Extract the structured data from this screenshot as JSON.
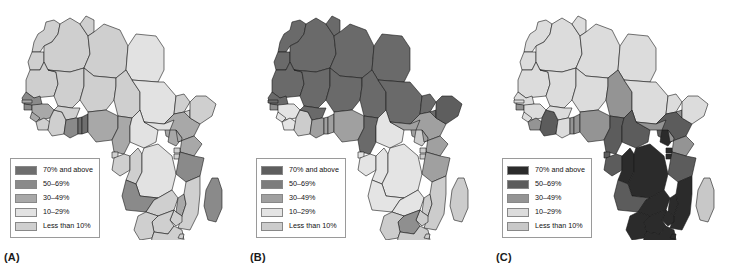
{
  "figure": {
    "title": "",
    "background": "#ffffff"
  },
  "legend_common": {
    "labels": [
      "70% and above",
      "50–69%",
      "30–49%",
      "10–29%",
      "Less than 10%"
    ]
  },
  "panels": [
    {
      "id": "A",
      "label": "(A)",
      "legend_colors": [
        "#6e6e6e",
        "#8a8a8a",
        "#a8a8a8",
        "#e2e2e2",
        "#cfcfcf"
      ],
      "regions": {
        "morocco": "#cfcfcf",
        "western_sahara": "#cfcfcf",
        "algeria": "#cfcfcf",
        "tunisia": "#cfcfcf",
        "libya": "#cfcfcf",
        "egypt": "#e2e2e2",
        "mauritania": "#cfcfcf",
        "mali": "#cfcfcf",
        "niger": "#cfcfcf",
        "chad": "#cfcfcf",
        "sudan": "#e2e2e2",
        "eritrea": "#cfcfcf",
        "djibouti": "#cfcfcf",
        "ethiopia": "#a8a8a8",
        "somalia": "#cfcfcf",
        "senegal": "#8a8a8a",
        "gambia": "#a8a8a8",
        "guinea_bissau": "#8a8a8a",
        "guinea": "#a8a8a8",
        "sierra_leone": "#a8a8a8",
        "liberia": "#cfcfcf",
        "cote_divoire": "#cfcfcf",
        "burkina_faso": "#cfcfcf",
        "ghana": "#8a8a8a",
        "togo": "#6e6e6e",
        "benin": "#6e6e6e",
        "nigeria": "#a8a8a8",
        "cameroon": "#a8a8a8",
        "car": "#e2e2e2",
        "south_sudan": "#e2e2e2",
        "equatorial_guinea": "#cfcfcf",
        "gabon": "#cfcfcf",
        "congo": "#cfcfcf",
        "drc": "#e2e2e2",
        "uganda": "#a8a8a8",
        "kenya": "#a8a8a8",
        "rwanda": "#cfcfcf",
        "burundi": "#cfcfcf",
        "tanzania": "#8a8a8a",
        "angola": "#8a8a8a",
        "zambia": "#cfcfcf",
        "malawi": "#a8a8a8",
        "mozambique": "#cfcfcf",
        "zimbabwe": "#cfcfcf",
        "botswana": "#cfcfcf",
        "namibia": "#cfcfcf",
        "south_africa": "#cfcfcf",
        "lesotho": "#cfcfcf",
        "swaziland": "#cfcfcf",
        "madagascar": "#8a8a8a"
      }
    },
    {
      "id": "B",
      "label": "(B)",
      "legend_colors": [
        "#5e5e5e",
        "#7d7d7d",
        "#a0a0a0",
        "#e4e4e4",
        "#cccccc"
      ],
      "regions": {
        "morocco": "#6a6a6a",
        "western_sahara": "#6a6a6a",
        "algeria": "#6a6a6a",
        "tunisia": "#6a6a6a",
        "libya": "#6a6a6a",
        "egypt": "#6a6a6a",
        "mauritania": "#6a6a6a",
        "mali": "#6a6a6a",
        "niger": "#6a6a6a",
        "chad": "#6a6a6a",
        "sudan": "#6a6a6a",
        "eritrea": "#6a6a6a",
        "djibouti": "#6a6a6a",
        "ethiopia": "#a0a0a0",
        "somalia": "#5e5e5e",
        "senegal": "#6a6a6a",
        "gambia": "#6a6a6a",
        "guinea_bissau": "#8f8f8f",
        "guinea": "#e4e4e4",
        "sierra_leone": "#e4e4e4",
        "liberia": "#e4e4e4",
        "cote_divoire": "#cccccc",
        "burkina_faso": "#6a6a6a",
        "ghana": "#a0a0a0",
        "togo": "#a0a0a0",
        "benin": "#a0a0a0",
        "nigeria": "#a0a0a0",
        "cameroon": "#6a6a6a",
        "car": "#e4e4e4",
        "south_sudan": "#a0a0a0",
        "equatorial_guinea": "#e4e4e4",
        "gabon": "#e4e4e4",
        "congo": "#e4e4e4",
        "drc": "#e4e4e4",
        "uganda": "#cccccc",
        "kenya": "#a0a0a0",
        "rwanda": "#cccccc",
        "burundi": "#cccccc",
        "tanzania": "#a0a0a0",
        "angola": "#e4e4e4",
        "zambia": "#e4e4e4",
        "malawi": "#cccccc",
        "mozambique": "#cccccc",
        "zimbabwe": "#cccccc",
        "botswana": "#8f8f8f",
        "namibia": "#cccccc",
        "south_africa": "#cccccc",
        "lesotho": "#cccccc",
        "swaziland": "#cccccc",
        "madagascar": "#cccccc"
      }
    },
    {
      "id": "C",
      "label": "(C)",
      "legend_colors": [
        "#2b2b2b",
        "#5c5c5c",
        "#949494",
        "#dcdcdc",
        "#c8c8c8"
      ],
      "regions": {
        "morocco": "#dcdcdc",
        "western_sahara": "#dcdcdc",
        "algeria": "#dcdcdc",
        "tunisia": "#dcdcdc",
        "libya": "#dcdcdc",
        "egypt": "#dcdcdc",
        "mauritania": "#dcdcdc",
        "mali": "#dcdcdc",
        "niger": "#dcdcdc",
        "chad": "#949494",
        "sudan": "#dcdcdc",
        "eritrea": "#dcdcdc",
        "djibouti": "#949494",
        "ethiopia": "#5c5c5c",
        "somalia": "#dcdcdc",
        "senegal": "#dcdcdc",
        "gambia": "#dcdcdc",
        "guinea_bissau": "#949494",
        "guinea": "#dcdcdc",
        "sierra_leone": "#dcdcdc",
        "liberia": "#949494",
        "cote_divoire": "#5c5c5c",
        "burkina_faso": "#dcdcdc",
        "ghana": "#dcdcdc",
        "togo": "#949494",
        "benin": "#949494",
        "nigeria": "#949494",
        "cameroon": "#5c5c5c",
        "car": "#5c5c5c",
        "south_sudan": "#949494",
        "equatorial_guinea": "#5c5c5c",
        "gabon": "#5c5c5c",
        "congo": "#2b2b2b",
        "drc": "#2b2b2b",
        "uganda": "#2b2b2b",
        "kenya": "#949494",
        "rwanda": "#2b2b2b",
        "burundi": "#2b2b2b",
        "tanzania": "#5c5c5c",
        "angola": "#5c5c5c",
        "zambia": "#2b2b2b",
        "malawi": "#2b2b2b",
        "mozambique": "#2b2b2b",
        "zimbabwe": "#2b2b2b",
        "botswana": "#2b2b2b",
        "namibia": "#2b2b2b",
        "south_africa": "#2b2b2b",
        "lesotho": "#2b2b2b",
        "swaziland": "#2b2b2b",
        "madagascar": "#c8c8c8"
      }
    }
  ]
}
